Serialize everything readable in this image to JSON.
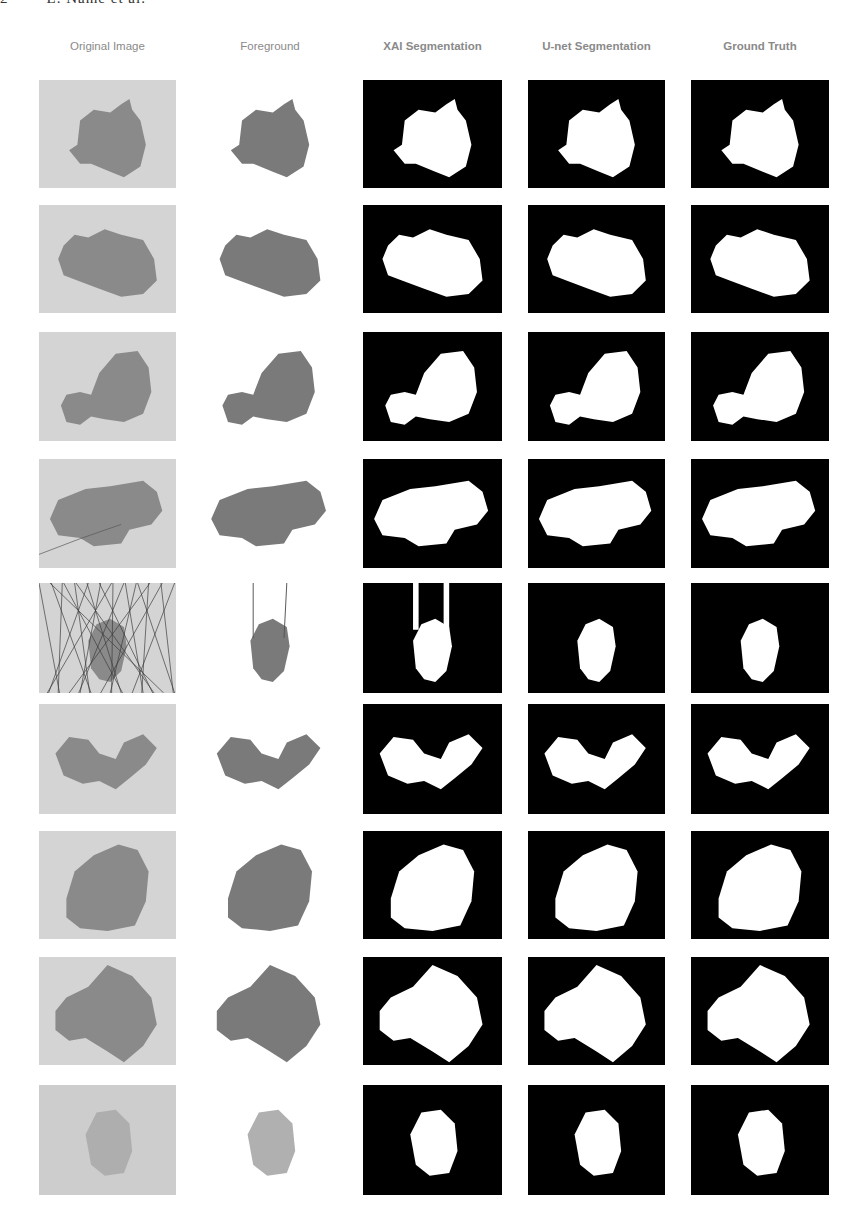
{
  "running_head": "2        L. Name et al.",
  "figure": {
    "columns": [
      {
        "key": "original",
        "label": "Original Image",
        "x": 39,
        "w": 137
      },
      {
        "key": "foreground",
        "label": "Foreground",
        "x": 200,
        "w": 140
      },
      {
        "key": "xai",
        "label": "XAI Segmentation",
        "x": 363,
        "w": 139
      },
      {
        "key": "unet",
        "label": "U-net Segmentation",
        "x": 528,
        "w": 137
      },
      {
        "key": "gt",
        "label": "Ground Truth",
        "x": 691,
        "w": 138
      }
    ],
    "rows": [
      {
        "index": 1,
        "y": 80,
        "h": 108,
        "desc": "two-lobed lesion with small protrusion at top right"
      },
      {
        "index": 2,
        "y": 205,
        "h": 108,
        "desc": "horizontally elongated irregular lesion"
      },
      {
        "index": 3,
        "y": 332,
        "h": 109,
        "desc": "small lobe left, large lobe right"
      },
      {
        "index": 4,
        "y": 459,
        "h": 109,
        "desc": "wide elongated lesion with hair"
      },
      {
        "index": 5,
        "y": 583,
        "h": 110,
        "desc": "small oval lesion heavily occluded by hair"
      },
      {
        "index": 6,
        "y": 704,
        "h": 110,
        "desc": "two separated lobes"
      },
      {
        "index": 7,
        "y": 831,
        "h": 108,
        "desc": "large oval lesion with two dark spots"
      },
      {
        "index": 8,
        "y": 957,
        "h": 108,
        "desc": "large irregular lesion with texture"
      },
      {
        "index": 9,
        "y": 1085,
        "h": 110,
        "desc": "small faint oval lesion"
      }
    ]
  },
  "colors": {
    "header_text": "#8a8a8a",
    "mask_bg": "#000000",
    "mask_fg": "#ffffff",
    "skin_bg": "#d6d6d6",
    "lesion": "#6e6e6e"
  }
}
